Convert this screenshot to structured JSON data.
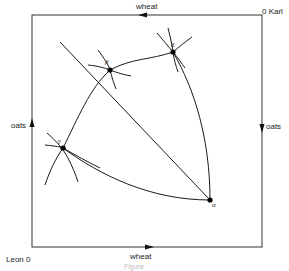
{
  "diagram": {
    "type": "edgeworth-box",
    "box": {
      "left": 32,
      "top": 15,
      "right": 262,
      "bottom": 247
    },
    "axes": {
      "top_label": "wheat",
      "bottom_label": "wheat",
      "left_label": "oats",
      "right_label": "oats"
    },
    "origins": {
      "top_right": "0 Karl",
      "bottom_left": "Leon 0"
    },
    "points": [
      {
        "name": "alpha",
        "label": "α",
        "x": 210,
        "y": 200
      },
      {
        "name": "beta",
        "label": "β",
        "x": 110,
        "y": 70
      },
      {
        "name": "gamma",
        "label": "γ",
        "x": 63,
        "y": 148
      },
      {
        "name": "delta",
        "label": "δ",
        "x": 173,
        "y": 52
      }
    ],
    "caption": "Figure"
  },
  "colors": {
    "line": "#1a1a1a",
    "caption": "#bbbbbb"
  }
}
